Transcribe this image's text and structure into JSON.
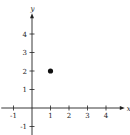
{
  "chart_data": {
    "type": "scatter",
    "title": "",
    "xlabel": "x",
    "ylabel": "y",
    "xlim": [
      -1.5,
      4.8
    ],
    "ylim": [
      -1.5,
      4.9
    ],
    "x_ticks": [
      -1,
      1,
      2,
      3,
      4
    ],
    "y_ticks": [
      -1,
      1,
      2,
      3,
      4
    ],
    "x_tick_labels": [
      "-1",
      "1",
      "2",
      "3",
      "4"
    ],
    "y_tick_labels": [
      "-1",
      "1",
      "2",
      "3",
      "4"
    ],
    "grid": false,
    "legend": null,
    "series": [
      {
        "name": "point",
        "points": [
          {
            "x": 1,
            "y": 2
          }
        ],
        "color": "#111111"
      }
    ]
  },
  "colors": {
    "axis": "#222222",
    "point": "#111111",
    "background": "#ffffff"
  }
}
